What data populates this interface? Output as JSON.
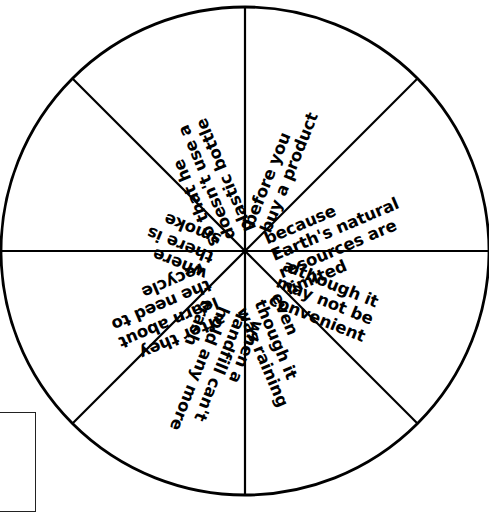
{
  "document": {
    "type": "spinner-wheel-worksheet",
    "title": "Sentence Starter Spinner",
    "background_color": "#ffffff",
    "ink_color": "#000000"
  },
  "wheel": {
    "center_x": 245,
    "center_y": 251,
    "radius": 244,
    "stroke_width": 2.6,
    "spoke_stroke_width": 2.2,
    "sector_count": 8,
    "sectors": [
      {
        "index": 0,
        "position": "top-right-upper",
        "start_angle_deg": -90,
        "end_angle_deg": -45,
        "text": "when a landfill can't hold any more trash",
        "lines": [
          "when a",
          "landfill can't",
          "hold any more",
          "trash"
        ],
        "text_rotation_deg": 112
      },
      {
        "index": 1,
        "position": "right-upper",
        "start_angle_deg": -45,
        "end_angle_deg": 0,
        "text": "after they learn about the need to recycle",
        "lines": [
          "after they",
          "learn about",
          "the need to",
          "recycle"
        ],
        "text_rotation_deg": 157
      },
      {
        "index": 2,
        "position": "right-lower",
        "start_angle_deg": 0,
        "end_angle_deg": 45,
        "text": "where there is smoke",
        "lines": [
          "where",
          "there is",
          "smoke"
        ],
        "text_rotation_deg": 202
      },
      {
        "index": 3,
        "position": "bottom-right",
        "start_angle_deg": 45,
        "end_angle_deg": 90,
        "text": "so that he doesn't use a plastic bottle",
        "lines": [
          "so that he",
          "doesn't use a",
          "plastic bottle"
        ],
        "text_rotation_deg": 247
      },
      {
        "index": 4,
        "position": "bottom-left",
        "start_angle_deg": 90,
        "end_angle_deg": 135,
        "text": "before you buy a product",
        "lines": [
          "before you",
          "buy a product"
        ],
        "text_rotation_deg": 292
      },
      {
        "index": 5,
        "position": "left-lower",
        "start_angle_deg": 135,
        "end_angle_deg": 180,
        "text": "because Earth's natural resources are limited",
        "lines": [
          "because",
          "Earth's natural",
          "resources are",
          "limited"
        ],
        "text_rotation_deg": 337
      },
      {
        "index": 6,
        "position": "left-upper",
        "start_angle_deg": 180,
        "end_angle_deg": 225,
        "text": "although it may not be convenient",
        "lines": [
          "although it",
          "may not be",
          "convenient"
        ],
        "text_rotation_deg": 22
      },
      {
        "index": 7,
        "position": "top-left",
        "start_angle_deg": 225,
        "end_angle_deg": 270,
        "text": "even though it was raining",
        "lines": [
          "even",
          "though it",
          "was raining"
        ],
        "text_rotation_deg": 67
      }
    ]
  },
  "note_box": {
    "visible_fragment": true,
    "title": "ner",
    "lines": [
      "lip",
      "er",
      "r."
    ]
  }
}
